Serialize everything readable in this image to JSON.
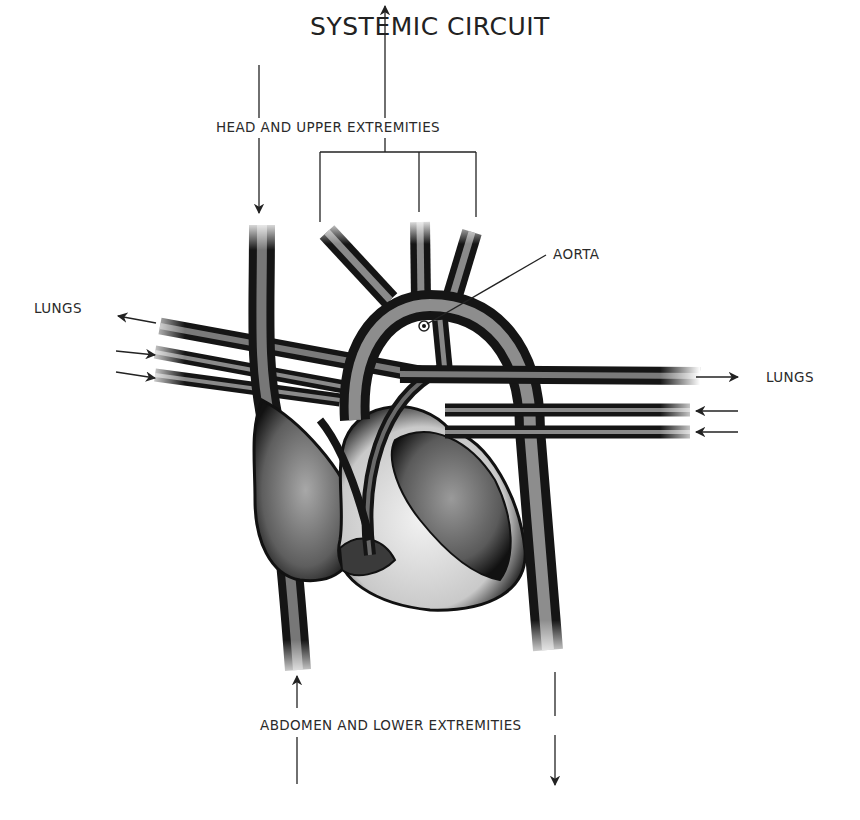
{
  "title": "SYSTEMIC CIRCUIT",
  "labels": {
    "head": "HEAD AND UPPER EXTREMITIES",
    "lungs_left": "LUNGS",
    "lungs_right": "LUNGS",
    "aorta": "AORTA",
    "abdomen": "ABDOMEN AND LOWER EXTREMITIES"
  },
  "colors": {
    "vessel_dark": "#1a1a1a",
    "vessel_mid": "#6b6b6b",
    "vessel_light": "#d8d8d8",
    "line": "#222222",
    "background": "#ffffff"
  },
  "flows": [
    {
      "from": "head and upper extremities",
      "to": "heart (superior vena cava)",
      "direction": "down"
    },
    {
      "from": "aorta branches",
      "to": "head and upper extremities",
      "direction": "up"
    },
    {
      "from": "heart (pulmonary artery)",
      "to": "lungs (left)",
      "direction": "left"
    },
    {
      "from": "lungs (left)",
      "to": "heart (pulmonary veins)",
      "direction": "right"
    },
    {
      "from": "heart (pulmonary artery)",
      "to": "lungs (right)",
      "direction": "right"
    },
    {
      "from": "lungs (right)",
      "to": "heart (pulmonary veins)",
      "direction": "left"
    },
    {
      "from": "abdomen and lower extremities",
      "to": "heart (inferior vena cava)",
      "direction": "up"
    },
    {
      "from": "heart (descending aorta)",
      "to": "abdomen and lower extremities",
      "direction": "down"
    }
  ]
}
